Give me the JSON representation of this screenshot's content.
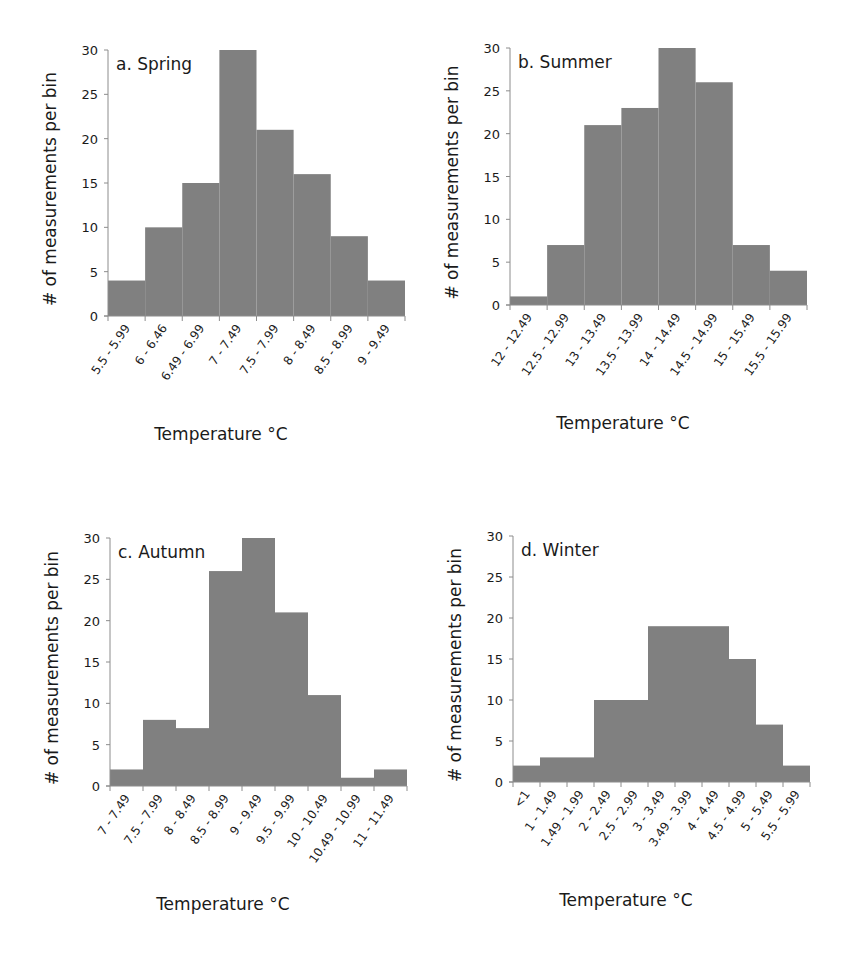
{
  "figure": {
    "bar_color": "#808080",
    "axis_color": "#8c8c8c",
    "ylabel": "# of measurements per bin",
    "xlabel": "Temperature °C"
  },
  "chart_data": [
    {
      "type": "bar",
      "title": "a. Spring",
      "xlabel": "Temperature °C",
      "ylabel": "# of measurements per bin",
      "ylim": [
        0,
        30
      ],
      "yticks": [
        0,
        5,
        10,
        15,
        20,
        25,
        30
      ],
      "categories": [
        "5.5 - 5.99",
        "6 - 6.46",
        "6.49 - 6.99",
        "7 - 7.49",
        "7.5 - 7.99",
        "8 - 8.49",
        "8.5 - 8.99",
        "9 - 9.49"
      ],
      "values": [
        4,
        10,
        15,
        30,
        21,
        16,
        9,
        4
      ],
      "grid": false
    },
    {
      "type": "bar",
      "title": "b. Summer",
      "xlabel": "Temperature °C",
      "ylabel": "# of measurements per bin",
      "ylim": [
        0,
        30
      ],
      "yticks": [
        0,
        5,
        10,
        15,
        20,
        25,
        30
      ],
      "categories": [
        "12 - 12.49",
        "12.5 - 12.99",
        "13 - 13.49",
        "13.5 - 13.99",
        "14 - 14.49",
        "14.5 - 14.99",
        "15 - 15.49",
        "15.5 - 15.99"
      ],
      "values": [
        1,
        7,
        21,
        23,
        30,
        26,
        7,
        4
      ],
      "grid": false
    },
    {
      "type": "bar",
      "title": "c. Autumn",
      "xlabel": "Temperature °C",
      "ylabel": "# of measurements per bin",
      "ylim": [
        0,
        30
      ],
      "yticks": [
        0,
        5,
        10,
        15,
        20,
        25,
        30
      ],
      "categories": [
        "7 - 7.49",
        "7.5 - 7.99",
        "8 - 8.49",
        "8.5 - 8.99",
        "9 - 9.49",
        "9.5 - 9.99",
        "10 - 10.49",
        "10.49 - 10.99",
        "11 - 11.49"
      ],
      "values": [
        2,
        8,
        7,
        26,
        30,
        21,
        11,
        1,
        2
      ],
      "grid": false
    },
    {
      "type": "bar",
      "title": "d. Winter",
      "xlabel": "Temperature °C",
      "ylabel": "# of measurements per bin",
      "ylim": [
        0,
        30
      ],
      "yticks": [
        0,
        5,
        10,
        15,
        20,
        25,
        30
      ],
      "categories": [
        "<1",
        "1 - 1.49",
        "1.49 - 1.99",
        "2 - 2.49",
        "2.5 - 2.99",
        "3 - 3.49",
        "3.49 - 3.99",
        "4 - 4.49",
        "4.5 - 4.99",
        "5 - 5.49",
        "5.5 - 5.99"
      ],
      "values": [
        2,
        3,
        3,
        10,
        10,
        19,
        19,
        19,
        15,
        7,
        2
      ],
      "grid": false
    }
  ]
}
